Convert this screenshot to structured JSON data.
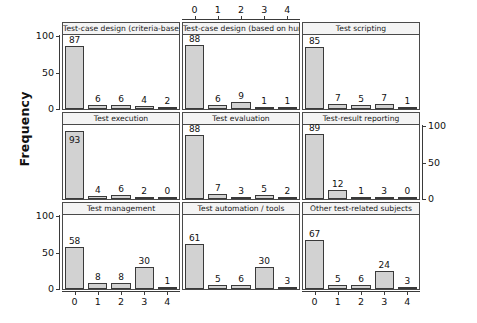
{
  "chart_data": {
    "type": "bar",
    "title": "",
    "xlabel": "",
    "ylabel": "Frequency",
    "ylim": [
      0,
      100
    ],
    "yticks": [
      0,
      50,
      100
    ],
    "xticks": [
      "0",
      "1",
      "2",
      "3",
      "4"
    ],
    "grid": false,
    "legend": null,
    "layout": "3x3 trellis of histograms",
    "categories": [
      "0",
      "1",
      "2",
      "3",
      "4"
    ],
    "panels": [
      {
        "title": "Test-case design (criteria-base",
        "row": 0,
        "col": 0,
        "categories": [
          "0",
          "1",
          "2",
          "3",
          "4"
        ],
        "values": [
          87,
          6,
          6,
          4,
          2
        ],
        "label_inside": false
      },
      {
        "title": "Test-case design (based on huma",
        "row": 0,
        "col": 1,
        "categories": [
          "0",
          "1",
          "2",
          "3",
          "4"
        ],
        "values": [
          88,
          6,
          9,
          1,
          1
        ],
        "label_inside": false
      },
      {
        "title": "Test scripting",
        "row": 0,
        "col": 2,
        "categories": [
          "0",
          "1",
          "2",
          "3",
          "4"
        ],
        "values": [
          85,
          7,
          5,
          7,
          1
        ],
        "label_inside": false
      },
      {
        "title": "Test execution",
        "row": 1,
        "col": 0,
        "categories": [
          "0",
          "1",
          "2",
          "3",
          "4"
        ],
        "values": [
          93,
          4,
          6,
          2,
          0
        ],
        "label_inside": true
      },
      {
        "title": "Test evaluation",
        "row": 1,
        "col": 1,
        "categories": [
          "0",
          "1",
          "2",
          "3",
          "4"
        ],
        "values": [
          88,
          7,
          3,
          5,
          2
        ],
        "label_inside": false
      },
      {
        "title": "Test-result reporting",
        "row": 1,
        "col": 2,
        "categories": [
          "0",
          "1",
          "2",
          "3",
          "4"
        ],
        "values": [
          89,
          12,
          1,
          3,
          0
        ],
        "label_inside": false
      },
      {
        "title": "Test management",
        "row": 2,
        "col": 0,
        "categories": [
          "0",
          "1",
          "2",
          "3",
          "4"
        ],
        "values": [
          58,
          8,
          8,
          30,
          1
        ],
        "label_inside": false
      },
      {
        "title": "Test automation / tools",
        "row": 2,
        "col": 1,
        "categories": [
          "0",
          "1",
          "2",
          "3",
          "4"
        ],
        "values": [
          61,
          5,
          6,
          30,
          3
        ],
        "label_inside": false
      },
      {
        "title": "Other test-related subjects",
        "row": 2,
        "col": 2,
        "categories": [
          "0",
          "1",
          "2",
          "3",
          "4"
        ],
        "values": [
          67,
          5,
          6,
          24,
          3
        ],
        "label_inside": false
      }
    ],
    "axes": {
      "left_rows": [
        0,
        2
      ],
      "right_rows": [
        1
      ],
      "top_cols": [
        1
      ],
      "bottom_cols": [
        0,
        2
      ]
    },
    "colors": {
      "bar_fill": "#d2d2d2",
      "bar_stroke": "#3a3a3a",
      "strip_fill": "#f4f4f4",
      "frame": "#4a4a4a",
      "text": "#111111",
      "background": "#ffffff"
    }
  }
}
